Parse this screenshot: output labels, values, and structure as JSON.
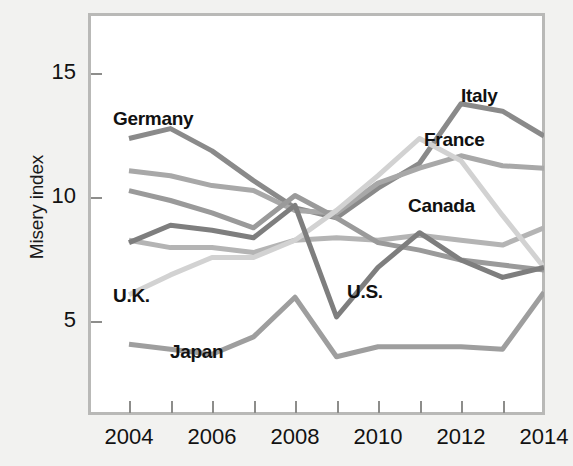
{
  "chart_data": {
    "type": "line",
    "title": "",
    "xlabel": "",
    "ylabel": "Misery index",
    "x": [
      2004,
      2005,
      2006,
      2007,
      2008,
      2009,
      2010,
      2011,
      2012,
      2013,
      2014
    ],
    "xtick_labels": [
      "2004",
      "2006",
      "2008",
      "2010",
      "2012",
      "2014"
    ],
    "xtick_values": [
      2004,
      2006,
      2008,
      2010,
      2012,
      2014
    ],
    "ytick_labels": [
      "5",
      "10",
      "15"
    ],
    "ytick_values": [
      5,
      10,
      15
    ],
    "xlim": [
      2004,
      2014
    ],
    "ylim": [
      1.2,
      17.2
    ],
    "grid": false,
    "legend_position": "inline-annotations",
    "series": [
      {
        "name": "Italy",
        "color": "#8a8a8a",
        "values": [
          12.4,
          12.8,
          11.9,
          10.7,
          9.6,
          9.2,
          10.4,
          11.4,
          13.8,
          13.5,
          12.5
        ]
      },
      {
        "name": "France",
        "color": "#a8a8a8",
        "values": [
          11.1,
          10.9,
          10.5,
          10.3,
          9.5,
          9.4,
          10.6,
          11.2,
          11.7,
          11.3,
          11.2
        ]
      },
      {
        "name": "Canada",
        "color": "#b4b4b4",
        "values": [
          8.3,
          8.0,
          8.0,
          7.8,
          8.3,
          8.4,
          8.3,
          8.5,
          8.3,
          8.1,
          8.8
        ]
      },
      {
        "name": "Germany",
        "color": "#9a9a9a",
        "values": [
          10.3,
          9.9,
          9.4,
          8.8,
          10.1,
          9.2,
          8.2,
          7.9,
          7.5,
          7.3,
          7.1
        ]
      },
      {
        "name": "U.K.",
        "color": "#d2d2d2",
        "values": [
          6.1,
          6.9,
          7.6,
          7.6,
          8.3,
          9.5,
          10.9,
          12.4,
          11.5,
          9.3,
          7.2
        ]
      },
      {
        "name": "U.S.",
        "color": "#7e7e7e",
        "values": [
          8.2,
          8.9,
          8.7,
          8.4,
          9.7,
          5.2,
          7.2,
          8.6,
          7.5,
          6.8,
          7.2
        ]
      },
      {
        "name": "Japan",
        "color": "#9e9e9e",
        "values": [
          4.1,
          3.9,
          3.7,
          4.4,
          6.0,
          3.6,
          4.0,
          4.0,
          4.0,
          3.9,
          6.2
        ]
      }
    ],
    "annotations": [
      {
        "text": "Germany",
        "x": 113,
        "y": 108
      },
      {
        "text": "Italy",
        "x": 461,
        "y": 85
      },
      {
        "text": "France",
        "x": 424,
        "y": 129
      },
      {
        "text": "Canada",
        "x": 408,
        "y": 195
      },
      {
        "text": "U.K.",
        "x": 113,
        "y": 285
      },
      {
        "text": "U.S.",
        "x": 347,
        "y": 281
      },
      {
        "text": "Japan",
        "x": 170,
        "y": 341
      }
    ]
  },
  "figure": {
    "background": "#f2f2f0",
    "plot_background": "#ffffff",
    "frame_color": "#b9b9b7"
  }
}
